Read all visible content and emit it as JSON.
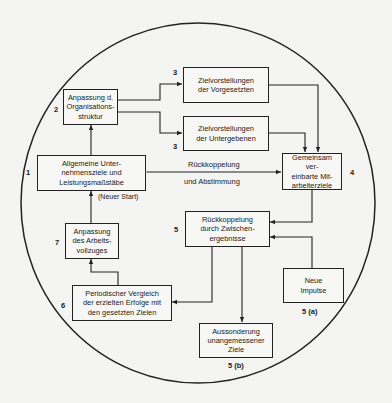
{
  "diagram": {
    "nodes": {
      "n1": {
        "number": "1",
        "text": "Allgemeine Unter-\nnehmensziele und\nLeistungsmaßstäbe"
      },
      "n2": {
        "number": "2",
        "text": "Anpassung d.\nOrganisations-\nstruktur"
      },
      "n3a": {
        "number": "3",
        "text": "Zielvorstellungen\nder Vorgesetzten"
      },
      "n3b": {
        "number": "3",
        "text": "Zielvorstellungen\nder Untergebenen"
      },
      "n4": {
        "number": "4",
        "text": "Gemeinsam ver-\neinbarte Mit-\narbeiterziele"
      },
      "n5": {
        "number": "5",
        "text": "Rückkoppelung\ndurch Zwischen-\nergebnisse"
      },
      "n5a": {
        "number": "5 (a)",
        "text": "Neue\nImpulse"
      },
      "n5b": {
        "number": "5 (b)",
        "text": "Aussonderung\nunangemessener\nZiele"
      },
      "n6": {
        "number": "6",
        "text": "Periodischer Vergleich\nder erzielten Erfolge mit\nden gesetzten Zielen"
      },
      "n7": {
        "number": "7",
        "text": "Anpassung\ndes Arbeits-\nvollzuges"
      }
    },
    "edge_labels": {
      "feedback_top": "Rückkoppelung",
      "feedback_bottom": "und Abstimmung",
      "restart": "(Neuer Start)"
    },
    "edges": [
      {
        "from": "n1",
        "to": "n2"
      },
      {
        "from": "n2",
        "to": "n3a"
      },
      {
        "from": "n2",
        "to": "n3b"
      },
      {
        "from": "n3a",
        "to": "n4"
      },
      {
        "from": "n3b",
        "to": "n4"
      },
      {
        "from": "n1",
        "to": "n4",
        "bidirectional": true
      },
      {
        "from": "n4",
        "to": "n5"
      },
      {
        "from": "n5a",
        "to": "n5"
      },
      {
        "from": "n5",
        "to": "n6"
      },
      {
        "from": "n5",
        "to": "n5b"
      },
      {
        "from": "n6",
        "to": "n7"
      },
      {
        "from": "n7",
        "to": "n1"
      }
    ],
    "colors": {
      "line": "#222222",
      "background": "#f4f4f2"
    }
  }
}
